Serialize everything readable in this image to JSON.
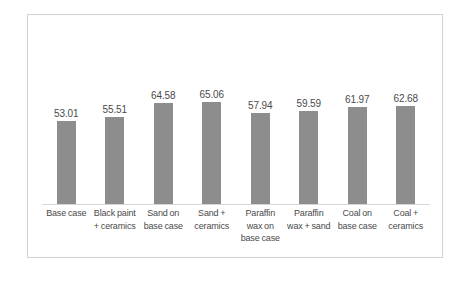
{
  "chart_data": {
    "type": "bar",
    "title": "",
    "subtitle": "",
    "xlabel": "",
    "ylabel": "",
    "grid": false,
    "legend": "none",
    "ylim": [
      0,
      121
    ],
    "bar_color": "#8d8d8d",
    "categories": [
      "Base case",
      "Black paint + ceramics",
      "Sand on base case",
      "Sand + ceramics",
      "Paraffin wax on base case",
      "Paraffin wax + sand",
      "Coal on base case",
      "Coal + ceramics"
    ],
    "values": [
      53.01,
      55.51,
      64.58,
      65.06,
      57.94,
      59.59,
      61.97,
      62.68
    ],
    "data_labels": [
      "53.01",
      "55.51",
      "64.58",
      "65.06",
      "57.94",
      "59.59",
      "61.97",
      "62.68"
    ]
  },
  "figure": {
    "frame_color": "#d2d2d2",
    "axis_color": "#d6d6d6",
    "background": "#ffffff",
    "text_color": "#4a4a4a"
  }
}
